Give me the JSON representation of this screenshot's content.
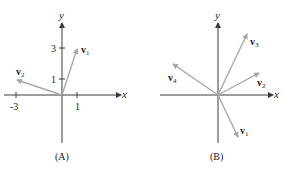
{
  "panels": [
    {
      "caption": "(A)",
      "axis_labels": {
        "x": "x",
        "y": "y"
      },
      "ticks": {
        "x": [
          "-3",
          "1"
        ],
        "y": [
          "1",
          "3"
        ]
      },
      "vectors": [
        {
          "name": "v",
          "sub": "1",
          "components": [
            1,
            3
          ]
        },
        {
          "name": "v",
          "sub": "2",
          "components": [
            -3,
            1
          ]
        }
      ]
    },
    {
      "caption": "(B)",
      "axis_labels": {
        "x": "x",
        "y": "y"
      },
      "vectors": [
        {
          "name": "v",
          "sub": "1"
        },
        {
          "name": "v",
          "sub": "2"
        },
        {
          "name": "v",
          "sub": "3"
        },
        {
          "name": "v",
          "sub": "4"
        }
      ]
    }
  ],
  "colors": {
    "axis": "#3a3a3a",
    "vector": "#a8a8a8",
    "text": "#222222"
  }
}
